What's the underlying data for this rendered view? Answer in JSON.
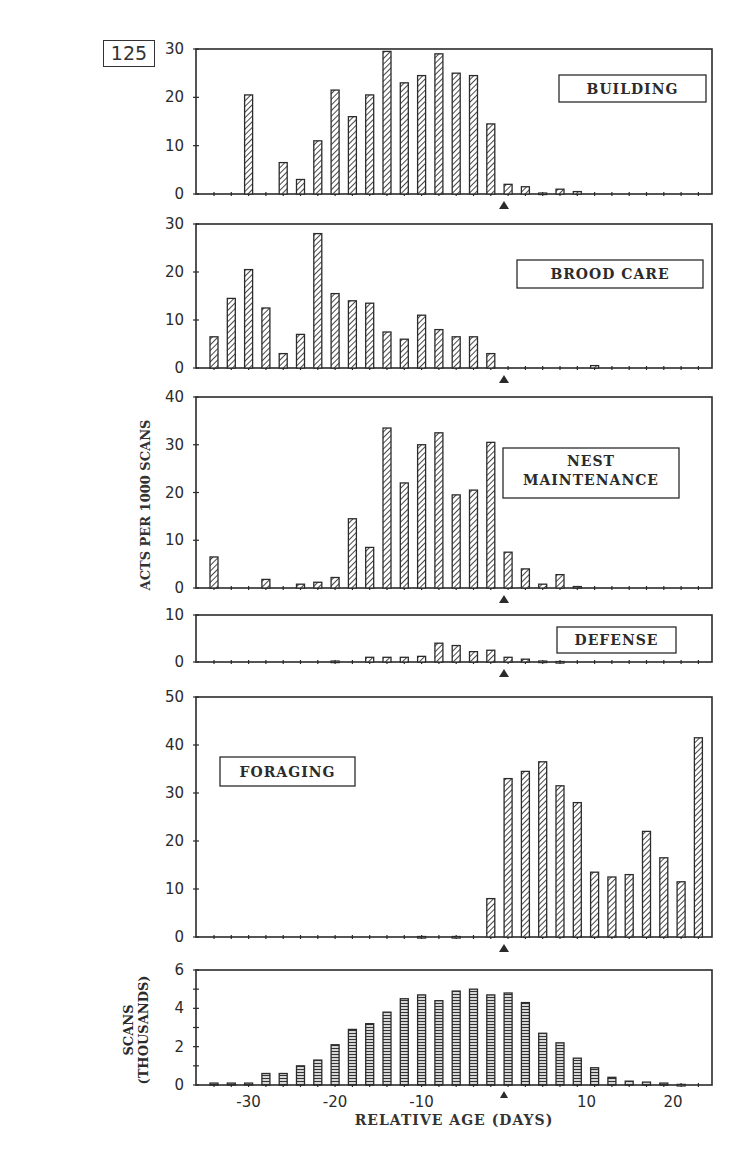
{
  "figure_number": "125",
  "y_axis_title": "ACTS PER 1000 SCANS",
  "x_axis_title": "RELATIVE AGE (DAYS)",
  "x_tick_labels": [
    {
      "label": "-30",
      "value": -30
    },
    {
      "label": "-20",
      "value": -20
    },
    {
      "label": "-10",
      "value": -10
    },
    {
      "label": "10",
      "value": 10
    },
    {
      "label": "20",
      "value": 20
    }
  ],
  "marker_day": 0,
  "colors": {
    "ink": "#2b2b2b",
    "background": "#ffffff"
  },
  "chart_data": [
    {
      "type": "bar",
      "title": "BUILDING",
      "ylabel": "ACTS PER 1000 SCANS",
      "xlabel": "RELATIVE AGE (DAYS)",
      "ylim": [
        0,
        30
      ],
      "yticks": [
        0,
        10,
        20,
        30
      ],
      "categories": [
        -34,
        -32,
        -30,
        -28,
        -26,
        -24,
        -22,
        -20,
        -18,
        -16,
        -14,
        -12,
        -10,
        -8,
        -6,
        -4,
        -2,
        1,
        3,
        5,
        7,
        9,
        11,
        13,
        15,
        17,
        19,
        21,
        23
      ],
      "values": [
        0,
        0,
        20.5,
        0,
        6.5,
        3,
        11,
        21.5,
        16,
        20.5,
        29.5,
        23,
        24.5,
        29,
        25,
        24.5,
        14.5,
        2,
        1.5,
        0.2,
        1,
        0.5,
        0,
        0,
        0,
        0,
        0,
        0,
        0
      ],
      "legend_position": "top-right"
    },
    {
      "type": "bar",
      "title": "BROOD CARE",
      "ylabel": "ACTS PER 1000 SCANS",
      "ylim": [
        0,
        30
      ],
      "yticks": [
        0,
        10,
        20,
        30
      ],
      "categories": [
        -34,
        -32,
        -30,
        -28,
        -26,
        -24,
        -22,
        -20,
        -18,
        -16,
        -14,
        -12,
        -10,
        -8,
        -6,
        -4,
        -2,
        1,
        3,
        5,
        7,
        9,
        11,
        13,
        15,
        17,
        19,
        21,
        23
      ],
      "values": [
        6.5,
        14.5,
        20.5,
        12.5,
        3,
        7,
        28,
        15.5,
        14,
        13.5,
        7.5,
        6,
        11,
        8,
        6.5,
        6.5,
        3,
        0,
        0,
        0,
        0,
        0,
        0.5,
        0,
        0,
        0,
        0,
        0,
        0
      ],
      "legend_position": "right"
    },
    {
      "type": "bar",
      "title": "NEST MAINTENANCE",
      "ylabel": "ACTS PER 1000 SCANS",
      "ylim": [
        0,
        40
      ],
      "yticks": [
        0,
        10,
        20,
        30,
        40
      ],
      "categories": [
        -34,
        -32,
        -30,
        -28,
        -26,
        -24,
        -22,
        -20,
        -18,
        -16,
        -14,
        -12,
        -10,
        -8,
        -6,
        -4,
        -2,
        1,
        3,
        5,
        7,
        9,
        11,
        13,
        15,
        17,
        19,
        21,
        23
      ],
      "values": [
        6.5,
        0,
        0,
        1.8,
        0,
        0.8,
        1.2,
        2.2,
        14.5,
        8.5,
        33.5,
        22,
        30,
        32.5,
        19.5,
        20.5,
        30.5,
        7.5,
        4,
        0.8,
        2.8,
        0.3,
        0,
        0,
        0,
        0,
        0,
        0,
        0
      ],
      "legend_position": "right"
    },
    {
      "type": "bar",
      "title": "DEFENSE",
      "ylabel": "ACTS PER 1000 SCANS",
      "ylim": [
        0,
        10
      ],
      "yticks": [
        0,
        10
      ],
      "categories": [
        -34,
        -32,
        -30,
        -28,
        -26,
        -24,
        -22,
        -20,
        -18,
        -16,
        -14,
        -12,
        -10,
        -8,
        -6,
        -4,
        -2,
        1,
        3,
        5,
        7,
        9,
        11,
        13,
        15,
        17,
        19,
        21,
        23
      ],
      "values": [
        0,
        0,
        0,
        0,
        0,
        0,
        0,
        0.2,
        0,
        1,
        1,
        1,
        1.2,
        4,
        3.5,
        2.2,
        2.5,
        1,
        0.6,
        0.2,
        0.1,
        0,
        0,
        0,
        0,
        0,
        0,
        0,
        0
      ],
      "legend_position": "top-right"
    },
    {
      "type": "bar",
      "title": "FORAGING",
      "ylabel": "ACTS PER 1000 SCANS",
      "ylim": [
        0,
        50
      ],
      "yticks": [
        0,
        10,
        20,
        30,
        40,
        50
      ],
      "categories": [
        -34,
        -32,
        -30,
        -28,
        -26,
        -24,
        -22,
        -20,
        -18,
        -16,
        -14,
        -12,
        -10,
        -8,
        -6,
        -4,
        -2,
        1,
        3,
        5,
        7,
        9,
        11,
        13,
        15,
        17,
        19,
        21,
        23
      ],
      "values": [
        0,
        0,
        0,
        0,
        0,
        0,
        0,
        0,
        0,
        0,
        0,
        0,
        0.1,
        0,
        0.1,
        0,
        8,
        33,
        34.5,
        36.5,
        31.5,
        28,
        13.5,
        12.5,
        13,
        22,
        16.5,
        11.5,
        41.5
      ],
      "legend_position": "left"
    },
    {
      "type": "bar",
      "title": "",
      "ylabel": "SCANS (THOUSANDS)",
      "xlabel": "RELATIVE AGE (DAYS)",
      "ylim": [
        0,
        6
      ],
      "yticks": [
        0,
        2,
        4,
        6
      ],
      "categories": [
        -34,
        -32,
        -30,
        -28,
        -26,
        -24,
        -22,
        -20,
        -18,
        -16,
        -14,
        -12,
        -10,
        -8,
        -6,
        -4,
        -2,
        1,
        3,
        5,
        7,
        9,
        11,
        13,
        15,
        17,
        19,
        21,
        23
      ],
      "values": [
        0.1,
        0.1,
        0.1,
        0.6,
        0.6,
        1,
        1.3,
        2.1,
        2.9,
        3.2,
        3.8,
        4.5,
        4.7,
        4.4,
        4.9,
        5,
        4.7,
        4.8,
        4.3,
        2.7,
        2.2,
        1.4,
        0.9,
        0.4,
        0.2,
        0.15,
        0.1,
        0.03,
        0
      ],
      "xticks": [
        -30,
        -20,
        -10,
        10,
        20
      ]
    }
  ]
}
